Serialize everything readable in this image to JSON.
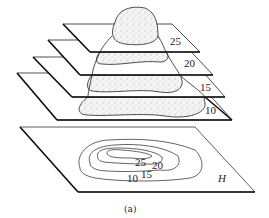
{
  "figure": {
    "caption": "(a)",
    "planes": [
      {
        "label": "25",
        "elevation": 25
      },
      {
        "label": "20",
        "elevation": 20
      },
      {
        "label": "15",
        "elevation": 15
      },
      {
        "label": "10",
        "elevation": 10
      }
    ],
    "projection_plane": {
      "label": "H",
      "contour_labels": [
        "25",
        "20",
        "15",
        "10"
      ]
    },
    "colors": {
      "line": "#1a1a1a",
      "stipple": "#9a9a9a",
      "background": "#ffffff"
    }
  }
}
